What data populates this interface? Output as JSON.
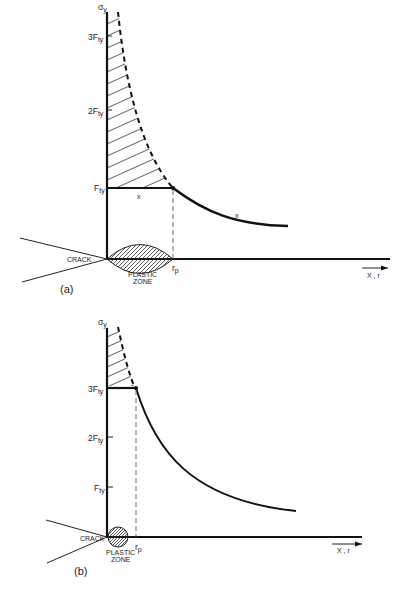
{
  "figure": {
    "panels": [
      {
        "id": "a",
        "panel_label": "(a)",
        "y_axis_label": "σ",
        "y_axis_sub": "y",
        "ticks": [
          {
            "label": "3F",
            "sub": "ty"
          },
          {
            "label": "2F",
            "sub": "ty"
          },
          {
            "label": "F",
            "sub": "ty"
          }
        ],
        "crack_label": "CRACK",
        "plastic_zone_label_1": "PLASTIC",
        "plastic_zone_label_2": "ZONE",
        "rp_label": "r",
        "rp_sub": "p",
        "x_marker_1": "x",
        "x_marker_2": "x",
        "x_axis_label": "X , r",
        "yield_level_multiple": 1
      },
      {
        "id": "b",
        "panel_label": "(b)",
        "y_axis_label": "σ",
        "y_axis_sub": "y",
        "ticks": [
          {
            "label": "3F",
            "sub": "ty"
          },
          {
            "label": "2F",
            "sub": "ty"
          },
          {
            "label": "F",
            "sub": "ty"
          }
        ],
        "crack_label": "CRACK",
        "plastic_zone_label_1": "PLASTIC",
        "plastic_zone_label_2": "ZONE",
        "rp_label": "r",
        "rp_sub": "p",
        "x_axis_label": "X , r",
        "yield_level_multiple": 3
      }
    ]
  }
}
